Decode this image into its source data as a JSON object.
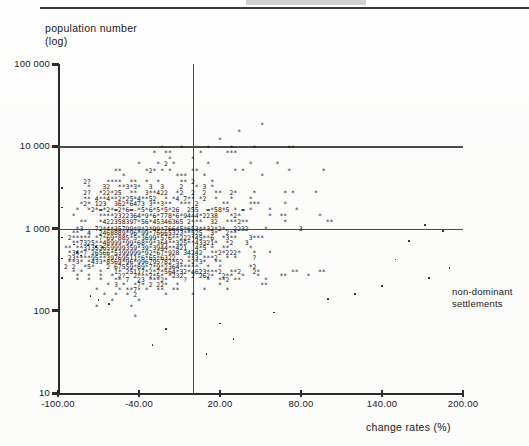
{
  "figure": {
    "background_color": "#fdfdfc",
    "ink_color": "#1a1a1a",
    "axis_color": "#2b2b2b",
    "reference_line_color": "#4a4a4a"
  },
  "axes": {
    "y_title_line1": "population number",
    "y_title_line2": "(log)",
    "x_title": "change rates (%)",
    "y_ticks": [
      "100 000",
      "10 000",
      "1 000",
      "100",
      "10"
    ],
    "x_ticks": [
      "-100.00",
      "-40.00",
      "20.00",
      "80.00",
      "140.00",
      "200.00"
    ]
  },
  "annotations": {
    "cluster_label_line1": "non-dominant",
    "cluster_label_line2": "settlements"
  },
  "chart_data": {
    "type": "scatter",
    "title": "",
    "xlabel": "change rates (%)",
    "ylabel": "population number (log)",
    "xlim": [
      -100.0,
      200.0
    ],
    "ylim": [
      10,
      100000
    ],
    "yscale": "log",
    "xtick_values": [
      -100.0,
      -40.0,
      20.0,
      80.0,
      140.0,
      200.0
    ],
    "xtick_labels": [
      "-100.00",
      "-40.00",
      "20.00",
      "80.00",
      "140.00",
      "200.00"
    ],
    "ytick_values": [
      100000,
      10000,
      1000,
      100,
      10
    ],
    "ytick_labels": [
      "100 000",
      "10 000",
      "1 000",
      "100",
      "10"
    ],
    "grid": false,
    "reference_lines": {
      "horizontal_y": [
        10000,
        1000
      ],
      "vertical_x": [
        0.0
      ]
    },
    "legend": "none",
    "overprint_notation": "line-printer plot: '*' = one settlement, digit n = n coincident settlements in that character cell",
    "n_character_rows": 48,
    "char_rows": [
      {
        "y": 18000,
        "text": "                                                   *"
      },
      {
        "y": 15000,
        "text": "                                             *"
      },
      {
        "y": 12000,
        "text": "                                        *"
      },
      {
        "y": 9500,
        "text": "                         *    *      *     *     *        **"
      },
      {
        "y": 8200,
        "text": "                       *  **       *      ***"
      },
      {
        "y": 7000,
        "text": "                           *     *"
      },
      {
        "y": 6000,
        "text": "                   *    * 2 *        *          *      *"
      },
      {
        "y": 5000,
        "text": "             **      *2* * *     **         * *           *        *"
      },
      {
        "y": 4300,
        "text": "               *             ***    *              *"
      },
      {
        "y": 3700,
        "text": "     2?    ****  **  *  *     ** 2    *"
      },
      {
        "y": 3200,
        "text": "      *   32  **3*3*  3  3    2   * 3 *"
      },
      {
        "y": 2700,
        "text": "     2?  *22*25  **  3**422  *2  2  2  **  2*    *       * *     *"
      },
      {
        "y": 2300,
        "text": "     ** 4**4**2*25*4**52  * *4 7** *2  *   *    *"
      },
      {
        "y": 2000,
        "text": "    *2* 123  362*6473 3**3**  *** 2      **     ***      *"
      },
      {
        "y": 1700,
        "text": "   *  *2*=*2*=2*6=-*5*6*5*5*26  255  =*58*5 * = *    *      *"
      },
      {
        "y": 1400,
        "text": "  *      ****2322364*9*6*778*6*9444*2238   *2*       *  **        *"
      },
      {
        "y": 1200,
        "text": "    **   *422358397*56*45346365 2***  32  ***2**         *          **"
      },
      {
        "y": 1000,
        "text": "   *3   72*4*35799*9*2*99*76645*653**32*2*  2232    *        3"
      },
      {
        "y": 880,
        "text": "  **  4  2468889*96*99*76665323**525  3*  2**"
      },
      {
        "y": 760,
        "text": " 2***** *7*69*885*5*3699*576**222*45**6  *3**   3***"
      },
      {
        "y": 660,
        "text": "  **7325**48999*99*68*9*364**325**43321*  *2   3"
      },
      {
        "y": 580,
        "text": "** **31353659999359*39*3944**421  4*5 *  **     *"
      },
      {
        "y": 500,
        "text": " *34*7 26566*5399999*92*67*928 34242  **2*222*   *   *"
      },
      {
        "y": 440,
        "text": " 23****95**39769511*6*65*6322   **3 ***2  * *    ?"
      },
      {
        "y": 390,
        "text": " **3* *433*8569*96*996795782*52 *2*3*  **"
      },
      {
        "y": 340,
        "text": "2 2  *5*   2 67559*89*7*9*2364*****  *  *       *2"
      },
      {
        "y": 300,
        "text": "  * *    *   1* 25117*2*7*564*32*4623***2  **2   2*        **     **"
      },
      {
        "y": 265,
        "text": "   *  *  *  * 2?  2***2*5* *232  2 262*  2**  *   *     **     *"
      },
      {
        "y": 235,
        "text": "   *  *  *   ** 7  23 ***2*    ?     *  **2 **      *"
      },
      {
        "y": 205,
        "text": "           * 3 *  *7* 2 22*  *          *          **"
      },
      {
        "y": 180,
        "text": "        *     * **7* *  **  **      *     *"
      },
      {
        "y": 155,
        "text": "          *  *  * 2       *      *"
      },
      {
        "y": 130,
        "text": "            *      *"
      },
      {
        "y": 110,
        "text": "        *        *"
      },
      {
        "y": 85,
        "text": "                  *"
      }
    ],
    "sparse_points": [
      {
        "x": -97,
        "y": 3100
      },
      {
        "x": -97,
        "y": 1800
      },
      {
        "x": -97,
        "y": 780
      },
      {
        "x": -97,
        "y": 430
      },
      {
        "x": -97,
        "y": 250
      },
      {
        "x": -88,
        "y": 640
      },
      {
        "x": -86,
        "y": 520
      },
      {
        "x": -83,
        "y": 470
      },
      {
        "x": -78,
        "y": 620
      },
      {
        "x": -72,
        "y": 600
      },
      {
        "x": -67,
        "y": 590
      },
      {
        "x": -76,
        "y": 150
      },
      {
        "x": -70,
        "y": 135
      },
      {
        "x": -62,
        "y": 120
      },
      {
        "x": 172,
        "y": 1100
      },
      {
        "x": 185,
        "y": 930
      },
      {
        "x": 160,
        "y": 700
      },
      {
        "x": 150,
        "y": 420
      },
      {
        "x": 190,
        "y": 330
      },
      {
        "x": 175,
        "y": 250
      },
      {
        "x": 140,
        "y": 200
      },
      {
        "x": 120,
        "y": 160
      },
      {
        "x": 100,
        "y": 140
      },
      {
        "x": 60,
        "y": 95
      },
      {
        "x": 20,
        "y": 70
      },
      {
        "x": -20,
        "y": 60
      },
      {
        "x": 30,
        "y": 45
      },
      {
        "x": -30,
        "y": 38
      },
      {
        "x": 10,
        "y": 30
      }
    ]
  }
}
